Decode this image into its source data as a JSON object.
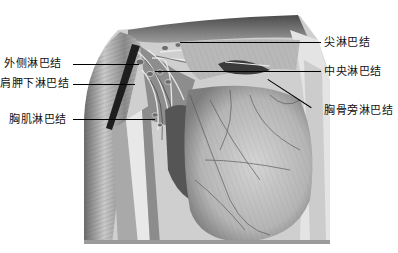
{
  "figure": {
    "labels": {
      "left": [
        {
          "id": "lateral",
          "text": "外侧淋巴结"
        },
        {
          "id": "subscapular",
          "text": "肩胛下淋巴结"
        },
        {
          "id": "pectoral",
          "text": "胸肌淋巴结"
        }
      ],
      "right": [
        {
          "id": "apical",
          "text": "尖淋巴结"
        },
        {
          "id": "central",
          "text": "中央淋巴结"
        },
        {
          "id": "parasternal",
          "text": "胸骨旁淋巴结"
        }
      ]
    },
    "colors": {
      "background": "#ffffff",
      "ink": "#111111",
      "tissue_light": "#d8d8d8",
      "tissue_mid": "#9a9a9a",
      "tissue_dark": "#3a3a3a"
    }
  }
}
